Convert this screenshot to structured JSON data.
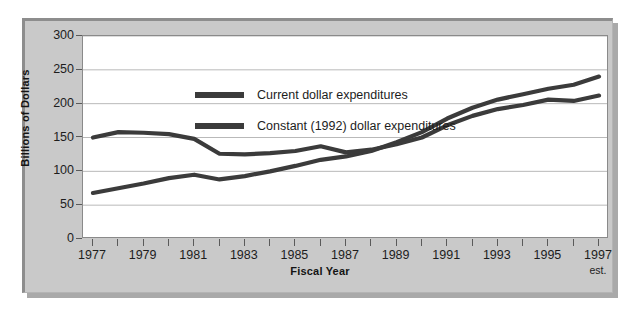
{
  "chart_data": {
    "type": "line",
    "title": "",
    "xlabel": "Fiscal Year",
    "ylabel": "Billions of Dollars",
    "ylim": [
      0,
      300
    ],
    "xlim": [
      1977,
      1997
    ],
    "yticks": [
      0,
      50,
      100,
      150,
      200,
      250,
      300
    ],
    "ytick_labels": [
      "0",
      "50",
      "100",
      "150",
      "200",
      "250",
      "300"
    ],
    "xticks": [
      1977,
      1978,
      1979,
      1980,
      1981,
      1982,
      1983,
      1984,
      1985,
      1986,
      1987,
      1988,
      1989,
      1990,
      1991,
      1992,
      1993,
      1994,
      1995,
      1996,
      1997
    ],
    "xtick_labels": [
      "1977",
      "",
      "1979",
      "",
      "1981",
      "",
      "1983",
      "",
      "1985",
      "",
      "1987",
      "",
      "1989",
      "",
      "1991",
      "",
      "1993",
      "",
      "1995",
      "",
      "1997"
    ],
    "x_last_sublabel": "est.",
    "grid": "horizontal",
    "legend_position": "top-left-inside",
    "x": [
      1977,
      1978,
      1979,
      1980,
      1981,
      1982,
      1983,
      1984,
      1985,
      1986,
      1987,
      1988,
      1989,
      1990,
      1991,
      1992,
      1993,
      1994,
      1995,
      1996,
      1997
    ],
    "series": [
      {
        "name": "Current dollar expenditures",
        "color": "#3b3b3b",
        "values": [
          68,
          75,
          82,
          90,
          95,
          88,
          93,
          100,
          108,
          117,
          122,
          130,
          143,
          158,
          178,
          194,
          206,
          214,
          222,
          228,
          240
        ]
      },
      {
        "name": "Constant (1992) dollar expenditures",
        "color": "#3b3b3b",
        "values": [
          150,
          158,
          157,
          155,
          148,
          126,
          125,
          127,
          130,
          137,
          128,
          132,
          140,
          150,
          168,
          182,
          192,
          198,
          206,
          204,
          212
        ]
      }
    ]
  },
  "legend": {
    "items": [
      {
        "label": "Current dollar expenditures"
      },
      {
        "label": "Constant (1992) dollar expenditures"
      }
    ]
  },
  "axes": {
    "y_title": "Billions of Dollars",
    "x_title": "Fiscal Year",
    "y_labels": [
      "300",
      "250",
      "200",
      "150",
      "100",
      "50",
      "0"
    ],
    "x_labels": [
      "1977",
      "1979",
      "1981",
      "1983",
      "1985",
      "1987",
      "1989",
      "1991",
      "1993",
      "1995",
      "1997"
    ],
    "x_estimate_note": "est."
  },
  "colors": {
    "panel": "#c9c9c9",
    "plot_background": "#ffffff",
    "line": "#3b3b3b",
    "grid": "#b9b9b9",
    "axis": "#5a5a5a",
    "text": "#1d1d1d"
  }
}
